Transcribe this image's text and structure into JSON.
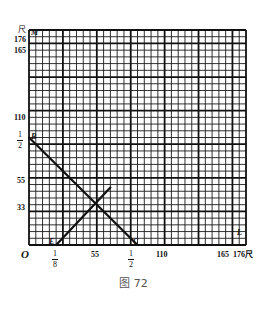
{
  "caption": "图 72",
  "axes": {
    "origin": "O",
    "x_unit": "尺",
    "y_unit": "尺",
    "x_ticks": [
      {
        "label": "1/8",
        "type": "fraction",
        "num": "1",
        "den": "8",
        "value": 22
      },
      {
        "label": "55",
        "value": 55
      },
      {
        "label": "1/2",
        "type": "fraction",
        "num": "1",
        "den": "2",
        "value": 88
      },
      {
        "label": "110",
        "value": 110
      },
      {
        "label": "165",
        "value": 165
      },
      {
        "label": "176尺",
        "value": 176
      }
    ],
    "y_ticks": [
      {
        "label": "33",
        "value": 33
      },
      {
        "label": "55",
        "value": 55
      },
      {
        "label": "1/2",
        "type": "fraction",
        "num": "1",
        "den": "2",
        "value": 88
      },
      {
        "label": "110",
        "value": 110
      },
      {
        "label": "165",
        "value": 165
      },
      {
        "label": "176",
        "value": 176
      }
    ]
  },
  "points": {
    "M": "M",
    "B": "B",
    "E": "E",
    "C": "C",
    "L": "L",
    "A": "A"
  },
  "grid": {
    "range": [
      0,
      176
    ],
    "minor_step": 5.5,
    "major_step": 27.5,
    "line_color": "#1a1a1a"
  },
  "chart_data": {
    "type": "line",
    "title": "图 72",
    "xlabel": "尺",
    "ylabel": "尺",
    "xlim": [
      0,
      176
    ],
    "ylim": [
      0,
      176
    ],
    "grid": true,
    "series": [
      {
        "name": "BC",
        "points": [
          [
            0,
            88
          ],
          [
            88,
            0
          ]
        ]
      },
      {
        "name": "EA",
        "points": [
          [
            22,
            0
          ],
          [
            66,
            47
          ]
        ]
      }
    ],
    "intersection": [
      55,
      33
    ],
    "annotations": [
      "M",
      "B",
      "E",
      "C",
      "L",
      "O"
    ]
  }
}
